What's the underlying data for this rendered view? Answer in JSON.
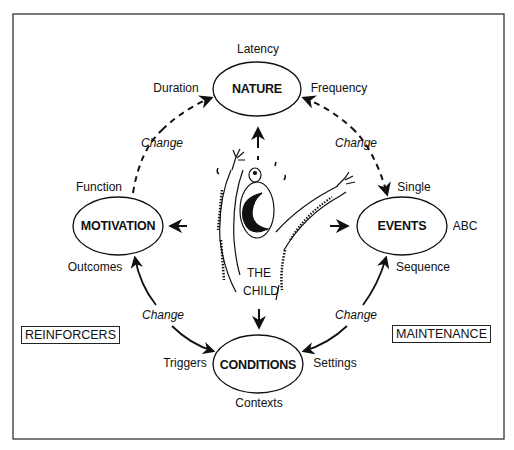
{
  "diagram": {
    "frame": {
      "x": 13,
      "y": 14,
      "w": 491,
      "h": 425
    },
    "center_figure": {
      "label_line1": "THE",
      "label_line2": "CHILD",
      "icon": "distressed-child-drawing"
    },
    "nodes": {
      "nature": {
        "label": "NATURE",
        "cx": 257,
        "cy": 89,
        "rx": 44,
        "ry": 27,
        "attributes": {
          "top": "Latency",
          "left": "Duration",
          "right": "Frequency"
        }
      },
      "motivation": {
        "label": "MOTIVATION",
        "cx": 118,
        "cy": 226,
        "rx": 45,
        "ry": 29,
        "attributes": {
          "top": "Function",
          "bottom": "Outcomes"
        }
      },
      "events": {
        "label": "EVENTS",
        "cx": 402,
        "cy": 226,
        "rx": 45,
        "ry": 29,
        "attributes": {
          "top": "Single",
          "right": "ABC",
          "bottom": "Sequence"
        }
      },
      "conditions": {
        "label": "CONDITIONS",
        "cx": 258,
        "cy": 364,
        "rx": 45,
        "ry": 29,
        "attributes": {
          "left": "Triggers",
          "right": "Settings",
          "bottom": "Contexts"
        }
      }
    },
    "cycle_edges": [
      {
        "from": "motivation",
        "to": "nature",
        "style": "dashed",
        "label": "Change"
      },
      {
        "from": "nature",
        "to": "events",
        "style": "dashed",
        "label": "Change"
      },
      {
        "from": "conditions",
        "to": "motivation",
        "style": "solid",
        "label": "Change"
      },
      {
        "from": "events",
        "to": "conditions",
        "style": "solid",
        "label": "Change"
      }
    ],
    "child_edges": [
      {
        "to": "nature",
        "direction": "up"
      },
      {
        "to": "motivation",
        "direction": "left"
      },
      {
        "to": "events",
        "direction": "right"
      },
      {
        "to": "conditions",
        "direction": "down"
      }
    ],
    "side_boxes": {
      "left": "REINFORCERS",
      "right": "MAINTENANCE"
    },
    "change_label": "Change",
    "colors": {
      "ink": "#111111",
      "background": "#ffffff",
      "frame": "#333333"
    }
  }
}
